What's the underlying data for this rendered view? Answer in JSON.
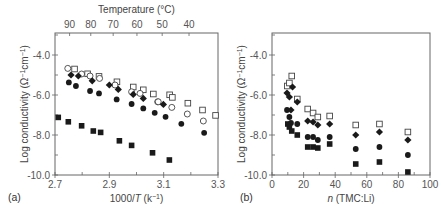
{
  "figure": {
    "panel_a_label": "(a)",
    "panel_b_label": "(b)"
  },
  "chart_data": [
    {
      "type": "scatter",
      "panel": "(a)",
      "title": "",
      "xlabel": "1000/T (k⁻¹)",
      "xlabel_parts": {
        "pre": "1000/",
        "italic": "T",
        "post": " (k",
        "sup": "−1",
        "end": ")"
      },
      "ylabel": "Log conductivity (Ω⁻¹cm⁻¹)",
      "top_xlabel": "Temperature (°C)",
      "xlim": [
        2.7,
        3.3
      ],
      "ylim": [
        -10.0,
        -2.9
      ],
      "xticks": [
        2.7,
        2.9,
        3.1,
        3.3
      ],
      "xtick_labels": [
        "2.7",
        "2.9",
        "3.1",
        "3.3"
      ],
      "yticks": [
        -4.0,
        -6.0,
        -8.0,
        -10.0
      ],
      "ytick_labels": [
        "-4.0",
        "-6.0",
        "-8.0",
        "-10.0"
      ],
      "top_ticks": [
        90,
        80,
        70,
        60,
        50,
        40
      ],
      "top_tick_labels": [
        "90",
        "80",
        "70",
        "60",
        "50",
        "40"
      ],
      "grid": false,
      "legend": null,
      "series": [
        {
          "name": "open-square",
          "marker": "square-open",
          "x": [
            2.772,
            2.82,
            2.862,
            2.928,
            2.988,
            3.025,
            3.062,
            3.122,
            3.132,
            3.189,
            3.243,
            3.291
          ],
          "y": [
            -4.7,
            -4.94,
            -5.07,
            -5.34,
            -5.6,
            -5.74,
            -5.95,
            -5.99,
            -6.12,
            -6.41,
            -6.75,
            -7.02
          ]
        },
        {
          "name": "open-circle",
          "marker": "circle-open",
          "x": [
            2.747,
            2.798,
            2.829,
            2.864,
            2.921,
            2.982,
            3.013,
            3.078,
            3.08,
            3.13,
            3.187,
            3.246
          ],
          "y": [
            -4.67,
            -4.95,
            -5.05,
            -5.17,
            -5.5,
            -5.84,
            -5.92,
            -6.34,
            -6.34,
            -6.62,
            -6.95,
            -7.3
          ]
        },
        {
          "name": "filled-diamond",
          "marker": "diamond-filled",
          "x": [
            2.759,
            2.786,
            2.837,
            2.9,
            2.933,
            2.988,
            3.025,
            3.099
          ],
          "y": [
            -5.0,
            -5.05,
            -5.29,
            -5.5,
            -5.72,
            -5.97,
            -6.17,
            -6.47
          ]
        },
        {
          "name": "filled-circle",
          "marker": "circle-filled",
          "x": [
            2.751,
            2.777,
            2.829,
            2.862,
            2.927,
            2.982,
            3.025,
            3.067,
            3.107,
            3.165,
            3.249
          ],
          "y": [
            -5.37,
            -5.55,
            -5.8,
            -5.92,
            -6.22,
            -6.45,
            -6.67,
            -6.89,
            -7.09,
            -7.44,
            -7.89
          ]
        },
        {
          "name": "filled-square",
          "marker": "square-filled",
          "x": [
            2.712,
            2.749,
            2.798,
            2.841,
            2.868,
            2.937,
            2.982,
            3.059,
            3.121
          ],
          "y": [
            -7.12,
            -7.34,
            -7.54,
            -7.8,
            -7.87,
            -8.29,
            -8.52,
            -8.89,
            -9.25
          ]
        }
      ]
    },
    {
      "type": "scatter",
      "panel": "(b)",
      "title": "",
      "xlabel": "n (TMC:Li)",
      "xlabel_parts": {
        "italic": "n",
        "post": " (TMC:Li)"
      },
      "ylabel": "Log conductivity (Ω⁻¹cm⁻¹)",
      "xlim": [
        0,
        100
      ],
      "ylim": [
        -10.0,
        -2.9
      ],
      "xticks": [
        0,
        20,
        40,
        60,
        80,
        100
      ],
      "xtick_labels": [
        "0",
        "20",
        "40",
        "60",
        "80",
        "100"
      ],
      "yticks": [
        -4.0,
        -6.0,
        -8.0,
        -10.0
      ],
      "ytick_labels": [
        "-4.0",
        "-6.0",
        "-8.0",
        "-10.0"
      ],
      "grid": false,
      "legend": null,
      "series": [
        {
          "name": "open-square",
          "marker": "square-open",
          "x": [
            9.7,
            11,
            12.5,
            16,
            22.6,
            26,
            29,
            36.5,
            53,
            68,
            86
          ],
          "y": [
            -5.55,
            -5.4,
            -5.05,
            -6.2,
            -6.7,
            -6.9,
            -7.1,
            -7.05,
            -7.5,
            -7.45,
            -7.85
          ]
        },
        {
          "name": "filled-diamond",
          "marker": "diamond-filled",
          "x": [
            9.5,
            11,
            12,
            13,
            16,
            22.6,
            26,
            29,
            36.5,
            53,
            68,
            86
          ],
          "y": [
            -5.9,
            -6.1,
            -6.75,
            -5.6,
            -6.35,
            -7.3,
            -7.35,
            -7.5,
            -7.45,
            -8.0,
            -7.85,
            -8.25
          ]
        },
        {
          "name": "filled-circle",
          "marker": "circle-filled",
          "x": [
            9.5,
            11,
            12,
            16,
            22.6,
            26,
            29,
            36.5,
            53,
            68,
            86
          ],
          "y": [
            -6.75,
            -7.1,
            -7.4,
            -7.45,
            -8.1,
            -8.1,
            -8.25,
            -8.1,
            -8.7,
            -8.6,
            -9.0
          ]
        },
        {
          "name": "filled-square",
          "marker": "square-filled",
          "x": [
            10,
            11,
            12.5,
            16,
            22.6,
            26,
            29,
            36.5,
            53,
            68,
            86
          ],
          "y": [
            -7.45,
            -7.6,
            -7.8,
            -8.0,
            -8.6,
            -8.6,
            -8.65,
            -8.45,
            -9.45,
            -9.35,
            -9.85
          ]
        }
      ]
    }
  ]
}
